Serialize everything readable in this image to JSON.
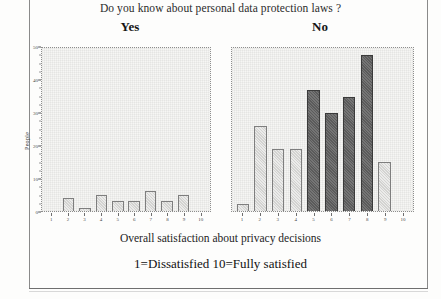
{
  "figure": {
    "title": "Do you know about personal data protection laws ?",
    "x_caption": "Overall satisfaction about privacy decisions",
    "scale_note": "1=Dissatisfied  10=Fully satisfied",
    "y_axis_label": "People"
  },
  "panels": {
    "yes": {
      "label": "Yes"
    },
    "no": {
      "label": "No"
    }
  },
  "axis": {
    "y_ticks": [
      "50",
      "40",
      "30",
      "20",
      "10",
      "0"
    ],
    "x_ticks": [
      "1",
      "2",
      "3",
      "4",
      "5",
      "6",
      "7",
      "8",
      "9",
      "10"
    ]
  },
  "colors": {
    "bar_light": "#d3d3d1",
    "bar_dark": "#5b5b5b",
    "plot_background": "#f6f6f4",
    "plot_border": "#8e8e8e",
    "page_frame": "#8a8a8a",
    "text": "#1a1a1a"
  },
  "chart_data": [
    {
      "type": "bar",
      "title": "Yes",
      "subtitle": "Do you know about personal data protection laws ?",
      "xlabel": "Overall satisfaction about privacy decisions",
      "ylabel": "People",
      "categories": [
        "1",
        "2",
        "3",
        "4",
        "5",
        "6",
        "7",
        "8",
        "9",
        "10"
      ],
      "values": [
        0,
        4,
        1,
        5,
        3,
        3,
        6,
        3,
        5,
        0
      ],
      "ylim": [
        0,
        50
      ],
      "yticks": [
        0,
        10,
        20,
        30,
        40,
        50
      ],
      "grid": false,
      "legend": "none",
      "bar_shades": [
        "light",
        "light",
        "light",
        "light",
        "light",
        "light",
        "light",
        "light",
        "light",
        "light"
      ]
    },
    {
      "type": "bar",
      "title": "No",
      "subtitle": "Do you know about personal data protection laws ?",
      "xlabel": "Overall satisfaction about privacy decisions",
      "ylabel": "People",
      "categories": [
        "1",
        "2",
        "3",
        "4",
        "5",
        "6",
        "7",
        "8",
        "9",
        "10"
      ],
      "values": [
        2,
        26,
        19,
        19,
        37,
        30,
        35,
        48,
        15,
        0
      ],
      "ylim": [
        0,
        50
      ],
      "yticks": [
        0,
        10,
        20,
        30,
        40,
        50
      ],
      "grid": false,
      "legend": "none",
      "bar_shades": [
        "light",
        "light",
        "light",
        "light",
        "dark",
        "dark",
        "dark",
        "dark",
        "light",
        "light"
      ]
    }
  ]
}
